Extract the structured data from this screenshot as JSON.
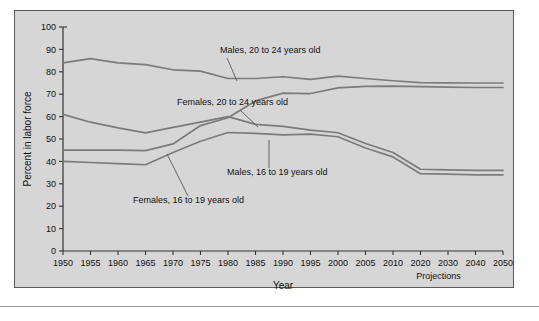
{
  "chart_data": {
    "type": "line",
    "title": "",
    "xlabel": "Year",
    "ylabel": "Percent in labor force",
    "ylim": [
      0,
      100
    ],
    "ytick_labels": [
      "100",
      "90",
      "80",
      "70",
      "60",
      "50",
      "40",
      "30",
      "20",
      "10",
      "0"
    ],
    "yticks": [
      100,
      90,
      80,
      70,
      60,
      50,
      40,
      30,
      20,
      10,
      0
    ],
    "xtick_labels": [
      "1950",
      "1955",
      "1960",
      "1965",
      "1970",
      "1975",
      "1980",
      "1985",
      "1990",
      "1995",
      "2000",
      "2005",
      "2010",
      "2020",
      "2030",
      "2040",
      "2050"
    ],
    "x": [
      1950,
      1955,
      1960,
      1965,
      1970,
      1975,
      1980,
      1985,
      1990,
      1995,
      2000,
      2005,
      2010,
      2020,
      2030,
      2040,
      2050
    ],
    "grid": false,
    "legend_position": "inline-annotations",
    "projection_note": "Projections",
    "projection_starts_at": "2000",
    "line_color": "#7b7b7b",
    "plot_background": "#d6d6d6",
    "series": [
      {
        "name": "Males, 20 to 24 years old",
        "values": [
          84.0,
          85.9,
          84.0,
          83.2,
          80.9,
          80.3,
          77.0,
          77.0,
          77.8,
          76.6,
          78.1,
          77.0,
          76.0,
          75.2,
          75.1,
          75.0,
          75.0
        ],
        "label_text": "Males, 20 to 24 years old"
      },
      {
        "name": "Females, 20 to 24 years old",
        "values": [
          45.0,
          45.0,
          45.0,
          44.8,
          47.8,
          56.0,
          59.5,
          67.0,
          70.5,
          70.3,
          72.8,
          73.5,
          73.6,
          73.4,
          73.2,
          73.0,
          73.0
        ],
        "label_text": "Females, 20 to 24 years old"
      },
      {
        "name": "Males, 16 to 19 years old",
        "values": [
          61.0,
          57.5,
          55.0,
          52.7,
          55.2,
          57.5,
          60.0,
          56.5,
          55.6,
          54.0,
          52.8,
          48.0,
          44.0,
          36.5,
          36.2,
          36.0,
          36.0
        ],
        "label_text": "Males, 16 to 19 years old"
      },
      {
        "name": "Females, 16 to 19 years old",
        "values": [
          40.0,
          39.5,
          39.0,
          38.5,
          44.0,
          49.0,
          52.9,
          52.5,
          51.8,
          52.2,
          51.0,
          46.0,
          42.0,
          34.5,
          34.3,
          34.0,
          34.0
        ],
        "label_text": "Females, 16 to 19 years old"
      }
    ],
    "annotations": [
      {
        "text": "Males, 20 to 24 years old",
        "anchor_x": 1972,
        "anchor_y": 77.5
      },
      {
        "text": "Females, 20 to 24 years old",
        "anchor_x": 1974,
        "anchor_y": 59.5
      },
      {
        "text": "Males, 16 to 19 years old",
        "anchor_x": 1982,
        "anchor_y": 57.0
      },
      {
        "text": "Females, 16 to 19 years old",
        "anchor_x": 1971,
        "anchor_y": 49.0
      }
    ]
  }
}
